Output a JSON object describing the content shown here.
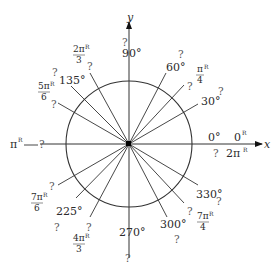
{
  "diagram": {
    "center": {
      "x": 129,
      "y": 144
    },
    "radius": 63,
    "axes": {
      "x_label": "x",
      "y_label": "y"
    },
    "unknown_mark": "?",
    "rays": [
      {
        "angle": 0,
        "degree_label": "0°",
        "radian_label": "0",
        "radian_sup": "R",
        "extra_radian": "2π",
        "extra_sup": "R",
        "unknown": "?"
      },
      {
        "angle": 30,
        "degree_label": "30°",
        "unknown": "?"
      },
      {
        "angle": 45,
        "radian_num": "π",
        "radian_den": "4",
        "radian_sup": "R",
        "unknown": "?"
      },
      {
        "angle": 60,
        "degree_label": "60°",
        "unknown": "?"
      },
      {
        "angle": 90,
        "degree_label": "90°",
        "unknown": "?"
      },
      {
        "angle": 120,
        "radian_num": "2π",
        "radian_den": "3",
        "radian_sup": "R",
        "unknown": "?"
      },
      {
        "angle": 135,
        "degree_label": "135°",
        "unknown": "?"
      },
      {
        "angle": 150,
        "radian_num": "5π",
        "radian_den": "6",
        "radian_sup": "R",
        "unknown": "?"
      },
      {
        "angle": 180,
        "radian_label": "π",
        "radian_sup": "R",
        "unknown": "?"
      },
      {
        "angle": 210,
        "radian_num": "7π",
        "radian_den": "6",
        "radian_sup": "R",
        "unknown": "?"
      },
      {
        "angle": 225,
        "degree_label": "225°",
        "unknown": "?"
      },
      {
        "angle": 240,
        "radian_num": "4π",
        "radian_den": "3",
        "radian_sup": "R",
        "unknown": "?"
      },
      {
        "angle": 270,
        "degree_label": "270°",
        "unknown": "?"
      },
      {
        "angle": 300,
        "degree_label": "300°",
        "unknown": "?"
      },
      {
        "angle": 315,
        "radian_num": "7π",
        "radian_den": "4",
        "radian_sup": "R",
        "unknown": "?"
      },
      {
        "angle": 330,
        "degree_label": "330°",
        "unknown": "?"
      }
    ]
  }
}
